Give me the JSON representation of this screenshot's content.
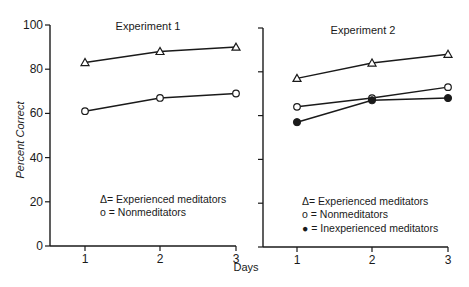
{
  "chart_data": [
    {
      "type": "line",
      "title": "Experiment 1",
      "xlabel": "Days",
      "ylabel": "Percent Correct",
      "x": [
        1,
        2,
        3
      ],
      "ylim": [
        0,
        100
      ],
      "yticks": [
        0,
        20,
        40,
        60,
        80,
        100
      ],
      "xticks": [
        1,
        2,
        3
      ],
      "grid": false,
      "legend_position": "lower-center",
      "series": [
        {
          "name": "Experienced meditators",
          "marker": "open-triangle",
          "symbol": "Δ",
          "values": [
            83,
            88,
            90
          ]
        },
        {
          "name": "Nonmeditators",
          "marker": "open-circle",
          "symbol": "o",
          "values": [
            61,
            67,
            69
          ]
        }
      ]
    },
    {
      "type": "line",
      "title": "Experiment 2",
      "xlabel": "Days",
      "ylabel": "Percent Correct",
      "x": [
        1,
        2,
        3
      ],
      "ylim": [
        0,
        100
      ],
      "yticks": [
        0,
        20,
        40,
        60,
        80,
        100
      ],
      "xticks": [
        1,
        2,
        3
      ],
      "grid": false,
      "legend_position": "lower-center",
      "series": [
        {
          "name": "Experienced meditators",
          "marker": "open-triangle",
          "symbol": "Δ",
          "values": [
            77,
            84,
            88
          ]
        },
        {
          "name": "Nonmeditators",
          "marker": "open-circle",
          "symbol": "o",
          "values": [
            64,
            68,
            73
          ]
        },
        {
          "name": "Inexperienced meditators",
          "marker": "filled-circle",
          "symbol": "●",
          "values": [
            57,
            67,
            68
          ]
        }
      ]
    }
  ],
  "labels": {
    "ylabel": "Percent Correct",
    "xlabel": "Days",
    "panel1_title": "Experiment 1",
    "panel2_title": "Experiment 2",
    "yticks": [
      "0",
      "20",
      "40",
      "60",
      "80",
      "100"
    ],
    "xticks": [
      "1",
      "2",
      "3"
    ],
    "legend1": [
      "Δ= Experienced meditators",
      "o = Nonmeditators"
    ],
    "legend2": [
      "Δ= Experienced meditators",
      "o = Nonmeditators",
      "● = Inexperienced meditators"
    ]
  },
  "colors": {
    "ink": "#1a1a1a",
    "background": "#ffffff"
  }
}
